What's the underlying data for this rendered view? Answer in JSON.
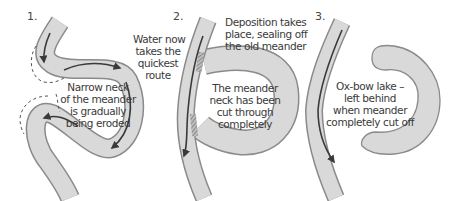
{
  "diagram": {
    "colors": {
      "river_fill": "#d9d9d9",
      "river_edge": "#8a8a8a",
      "flow_arrow": "#3a3a3a",
      "dashed_line": "#555555",
      "text": "#3a3a3a"
    },
    "stages": [
      {
        "number": "1.",
        "labels": [
          {
            "lines": [
              "Narrow neck",
              "of the meander",
              "is gradually",
              "being eroded"
            ]
          }
        ]
      },
      {
        "number": "2.",
        "labels": [
          {
            "lines": [
              "Water now",
              "takes the",
              "quickest",
              "route"
            ]
          },
          {
            "lines": [
              "Deposition takes",
              "place, sealing off",
              "the old meander"
            ]
          },
          {
            "lines": [
              "The meander",
              "neck has been",
              "cut through",
              "completely"
            ]
          }
        ]
      },
      {
        "number": "3.",
        "labels": [
          {
            "lines": [
              "Ox-bow lake –",
              "left behind",
              "when meander",
              "completely cut off"
            ]
          }
        ]
      }
    ]
  }
}
